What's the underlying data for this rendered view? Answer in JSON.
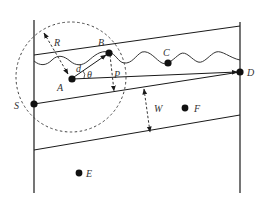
{
  "diagram": {
    "type": "geometric-schematic",
    "stroke_color": "#1a1a1a",
    "dash_color": "#444444",
    "points": [
      {
        "id": "A",
        "label": "A",
        "x": 72,
        "y": 79
      },
      {
        "id": "B",
        "label": "B",
        "x": 109,
        "y": 53
      },
      {
        "id": "C",
        "label": "C",
        "x": 168,
        "y": 63
      },
      {
        "id": "D",
        "label": "D",
        "x": 240,
        "y": 72
      },
      {
        "id": "S",
        "label": "S",
        "x": 34,
        "y": 104
      },
      {
        "id": "E",
        "label": "E",
        "x": 79,
        "y": 173
      },
      {
        "id": "F",
        "label": "F",
        "x": 186,
        "y": 108
      }
    ],
    "labels": {
      "R": "R",
      "d": "d",
      "theta": "θ",
      "P": "P",
      "W": "W",
      "A": "A",
      "B": "B",
      "C": "C",
      "D": "D",
      "S": "S",
      "E": "E",
      "F": "F"
    },
    "circle": {
      "cx": 71,
      "cy": 77,
      "r": 55,
      "style": "dashed"
    },
    "annotations": [
      {
        "name": "R",
        "meaning": "radius arrow from circle edge to A"
      },
      {
        "name": "d",
        "meaning": "distance A to B"
      },
      {
        "name": "θ",
        "meaning": "angle between AB and AD"
      },
      {
        "name": "P",
        "meaning": "dashed arrow from B downward"
      },
      {
        "name": "W",
        "meaning": "width between two slanted lines"
      }
    ]
  }
}
